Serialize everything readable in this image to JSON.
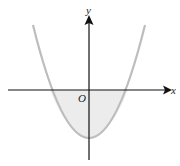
{
  "diagram": {
    "type": "parabola-graph",
    "labels": {
      "y_axis": "y",
      "x_axis": "x",
      "origin": "O"
    },
    "colors": {
      "curve": "#bdbdbd",
      "shaded_region": "#ececec",
      "axes": "#111111"
    }
  }
}
